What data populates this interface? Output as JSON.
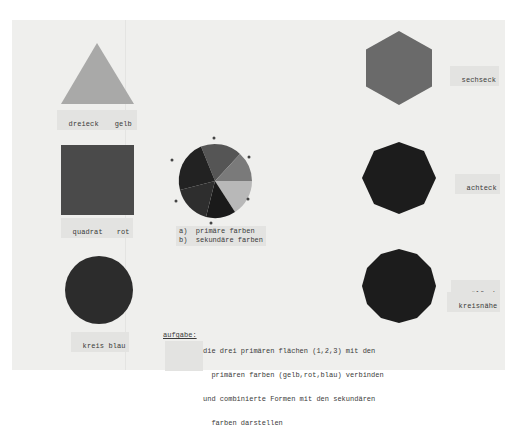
{
  "document": {
    "colors": {
      "paper": "#efefed",
      "label_bg": "#e3e3e1",
      "text": "#3a3a3a",
      "triangle": "#a9a9a8",
      "square": "#4a4a4a",
      "circle": "#2c2c2c",
      "hexagon": "#6a6a6a",
      "octagon": "#1c1c1c",
      "dodecagon": "#1c1c1c"
    },
    "shapes": [
      {
        "id": "triangle",
        "label": "dreieck",
        "color_label": "gelb"
      },
      {
        "id": "square",
        "label": "quadrat",
        "color_label": "rot"
      },
      {
        "id": "circle",
        "label": "kreis blau"
      },
      {
        "id": "hexagon",
        "label": "sechseck"
      },
      {
        "id": "octagon",
        "label": "achteck"
      },
      {
        "id": "dodecagon",
        "label": "zwölfeck",
        "sublabel": "kreisnähe"
      }
    ],
    "color_wheel": {
      "markers": [
        "a",
        "b",
        "a",
        "b",
        "a",
        "b"
      ],
      "segments": [
        {
          "name": "segment-1",
          "color": "#555555"
        },
        {
          "name": "segment-2",
          "color": "#7a7a7a"
        },
        {
          "name": "segment-3",
          "color": "#b8b8b8"
        },
        {
          "name": "segment-4",
          "color": "#222222"
        },
        {
          "name": "segment-5",
          "color": "#2e2e2e"
        },
        {
          "name": "segment-6",
          "color": "#1a1a1a"
        }
      ],
      "legend": {
        "a": "a)  primäre farben",
        "b": "b)  sekundäre farben"
      }
    },
    "task": {
      "heading": "aufgabe:",
      "lines": [
        "die drei primären flächen (1,2,3) mit den",
        "  primären farben (gelb,rot,blau) verbinden",
        "und combinierte Formen mit den sekundären",
        "  farben darstellen"
      ]
    }
  }
}
